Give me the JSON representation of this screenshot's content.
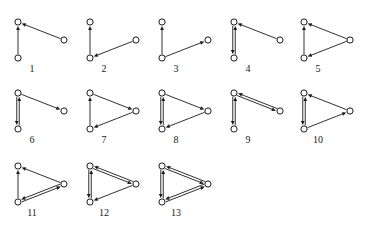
{
  "figure": {
    "background_color": "#ffffff",
    "ink_color": "#1a1a1a",
    "node_fill": "#ffffff",
    "vertex_count": 3,
    "diagram_count": 13,
    "rows": [
      {
        "labels": [
          "1",
          "2",
          "3",
          "4",
          "5"
        ]
      },
      {
        "labels": [
          "6",
          "7",
          "8",
          "9",
          "10"
        ]
      },
      {
        "labels": [
          "11",
          "12",
          "13"
        ]
      }
    ],
    "vertex_names": {
      "A": "top-left",
      "B": "bottom-left",
      "C": "right"
    }
  },
  "diagrams": [
    {
      "label": "1",
      "row": 0,
      "col": 0,
      "shape": "wide",
      "nodes": {
        "A": [
          16,
          20
        ],
        "B": [
          16,
          56
        ],
        "C": [
          62,
          38
        ]
      },
      "edges": [
        {
          "from": "B",
          "to": "A",
          "bidirectional": false
        },
        {
          "from": "C",
          "to": "A",
          "bidirectional": false
        }
      ]
    },
    {
      "label": "2",
      "row": 0,
      "col": 1,
      "shape": "wide",
      "nodes": {
        "A": [
          16,
          20
        ],
        "B": [
          16,
          56
        ],
        "C": [
          62,
          38
        ]
      },
      "edges": [
        {
          "from": "B",
          "to": "A",
          "bidirectional": false
        },
        {
          "from": "C",
          "to": "B",
          "bidirectional": false
        }
      ]
    },
    {
      "label": "3",
      "row": 0,
      "col": 2,
      "shape": "wide",
      "nodes": {
        "A": [
          16,
          20
        ],
        "B": [
          16,
          56
        ],
        "C": [
          62,
          38
        ]
      },
      "edges": [
        {
          "from": "B",
          "to": "A",
          "bidirectional": false
        },
        {
          "from": "B",
          "to": "C",
          "bidirectional": false
        }
      ]
    },
    {
      "label": "4",
      "row": 0,
      "col": 3,
      "shape": "wide",
      "nodes": {
        "A": [
          16,
          20
        ],
        "B": [
          16,
          56
        ],
        "C": [
          62,
          38
        ]
      },
      "edges": [
        {
          "from": "A",
          "to": "B",
          "bidirectional": true
        },
        {
          "from": "C",
          "to": "A",
          "bidirectional": false
        }
      ]
    },
    {
      "label": "5",
      "row": 0,
      "col": 4,
      "shape": "wide",
      "nodes": {
        "A": [
          16,
          20
        ],
        "B": [
          16,
          56
        ],
        "C": [
          62,
          38
        ]
      },
      "edges": [
        {
          "from": "B",
          "to": "A",
          "bidirectional": false
        },
        {
          "from": "C",
          "to": "A",
          "bidirectional": false
        },
        {
          "from": "C",
          "to": "B",
          "bidirectional": false
        }
      ]
    },
    {
      "label": "6",
      "row": 1,
      "col": 0,
      "shape": "wide",
      "nodes": {
        "A": [
          16,
          20
        ],
        "B": [
          16,
          56
        ],
        "C": [
          62,
          38
        ]
      },
      "edges": [
        {
          "from": "A",
          "to": "B",
          "bidirectional": true
        },
        {
          "from": "A",
          "to": "C",
          "bidirectional": false
        }
      ]
    },
    {
      "label": "7",
      "row": 1,
      "col": 1,
      "shape": "wide",
      "nodes": {
        "A": [
          16,
          20
        ],
        "B": [
          16,
          56
        ],
        "C": [
          62,
          38
        ]
      },
      "edges": [
        {
          "from": "B",
          "to": "A",
          "bidirectional": false
        },
        {
          "from": "A",
          "to": "C",
          "bidirectional": false
        },
        {
          "from": "C",
          "to": "B",
          "bidirectional": false
        }
      ]
    },
    {
      "label": "8",
      "row": 1,
      "col": 2,
      "shape": "wide",
      "nodes": {
        "A": [
          16,
          20
        ],
        "B": [
          16,
          56
        ],
        "C": [
          62,
          38
        ]
      },
      "edges": [
        {
          "from": "A",
          "to": "B",
          "bidirectional": true
        },
        {
          "from": "A",
          "to": "C",
          "bidirectional": false
        },
        {
          "from": "C",
          "to": "B",
          "bidirectional": false
        }
      ]
    },
    {
      "label": "9",
      "row": 1,
      "col": 3,
      "shape": "wide",
      "nodes": {
        "A": [
          16,
          20
        ],
        "B": [
          16,
          56
        ],
        "C": [
          62,
          38
        ]
      },
      "edges": [
        {
          "from": "A",
          "to": "B",
          "bidirectional": true
        },
        {
          "from": "A",
          "to": "C",
          "bidirectional": true
        }
      ]
    },
    {
      "label": "10",
      "row": 1,
      "col": 4,
      "shape": "wide",
      "nodes": {
        "A": [
          16,
          20
        ],
        "B": [
          16,
          56
        ],
        "C": [
          62,
          38
        ]
      },
      "edges": [
        {
          "from": "A",
          "to": "B",
          "bidirectional": true
        },
        {
          "from": "C",
          "to": "A",
          "bidirectional": false
        },
        {
          "from": "B",
          "to": "C",
          "bidirectional": false
        }
      ]
    },
    {
      "label": "11",
      "row": 2,
      "col": 0,
      "shape": "wide",
      "nodes": {
        "A": [
          16,
          20
        ],
        "B": [
          16,
          56
        ],
        "C": [
          62,
          38
        ]
      },
      "edges": [
        {
          "from": "B",
          "to": "A",
          "bidirectional": false
        },
        {
          "from": "C",
          "to": "A",
          "bidirectional": false
        },
        {
          "from": "B",
          "to": "C",
          "bidirectional": true
        }
      ]
    },
    {
      "label": "12",
      "row": 2,
      "col": 1,
      "shape": "wide",
      "nodes": {
        "A": [
          16,
          20
        ],
        "B": [
          16,
          56
        ],
        "C": [
          62,
          38
        ]
      },
      "edges": [
        {
          "from": "A",
          "to": "B",
          "bidirectional": true
        },
        {
          "from": "A",
          "to": "C",
          "bidirectional": true
        },
        {
          "from": "C",
          "to": "B",
          "bidirectional": false
        }
      ]
    },
    {
      "label": "13",
      "row": 2,
      "col": 2,
      "shape": "wide",
      "nodes": {
        "A": [
          16,
          20
        ],
        "B": [
          16,
          56
        ],
        "C": [
          62,
          38
        ]
      },
      "edges": [
        {
          "from": "A",
          "to": "B",
          "bidirectional": true
        },
        {
          "from": "A",
          "to": "C",
          "bidirectional": true
        },
        {
          "from": "B",
          "to": "C",
          "bidirectional": true
        }
      ]
    }
  ],
  "layout": {
    "cell_width": 72,
    "cell_height": 73,
    "row_origins_y": [
      2,
      73,
      146
    ],
    "col_origins_x": [
      2,
      74,
      146,
      218,
      288
    ],
    "node_radius": 3.1,
    "label_offset_y": 70,
    "label_offset_x": 30
  }
}
